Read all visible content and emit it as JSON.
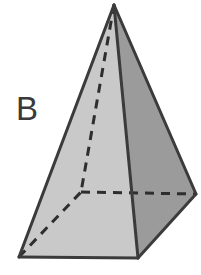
{
  "figure": {
    "label": "B",
    "shape_name": "square-pyramid",
    "projection": "oblique",
    "colors": {
      "background": "#ffffff",
      "left_face_fill": "#c9c9c9",
      "right_face_fill": "#9b9b9b",
      "base_front_fill": "#cfcfcf",
      "outline": "#3b3b3b",
      "hidden_edge": "#2e2e2e",
      "label_color": "#3a3a3a"
    },
    "stroke": {
      "outline_width": 3,
      "hidden_width": 3,
      "hidden_dash": "9 7"
    },
    "vertices": {
      "apex": {
        "x": 114,
        "y": 5
      },
      "base_left": {
        "x": 19,
        "y": 257
      },
      "base_front": {
        "x": 138,
        "y": 258
      },
      "base_right": {
        "x": 196,
        "y": 194
      },
      "base_back_hidden": {
        "x": 81,
        "y": 192
      }
    },
    "faces": [
      {
        "name": "left-visible-face",
        "points": "114,5 19,257 138,258",
        "fill": "#c9c9c9"
      },
      {
        "name": "right-visible-face",
        "points": "114,5 138,258 196,194",
        "fill": "#9b9b9b"
      }
    ],
    "visible_edges": [
      {
        "name": "apex-to-base-left",
        "x1": 114,
        "y1": 5,
        "x2": 19,
        "y2": 257
      },
      {
        "name": "apex-to-base-front",
        "x1": 114,
        "y1": 5,
        "x2": 138,
        "y2": 258
      },
      {
        "name": "apex-to-base-right",
        "x1": 114,
        "y1": 5,
        "x2": 196,
        "y2": 194
      },
      {
        "name": "base-left-to-base-front",
        "x1": 19,
        "y1": 257,
        "x2": 138,
        "y2": 258
      },
      {
        "name": "base-front-to-base-right",
        "x1": 138,
        "y1": 258,
        "x2": 196,
        "y2": 194
      }
    ],
    "hidden_edges": [
      {
        "name": "apex-to-back-vertex",
        "x1": 114,
        "y1": 5,
        "x2": 81,
        "y2": 192
      },
      {
        "name": "base-left-to-back-vertex",
        "x1": 19,
        "y1": 257,
        "x2": 81,
        "y2": 192
      },
      {
        "name": "back-vertex-to-base-right",
        "x1": 81,
        "y1": 192,
        "x2": 196,
        "y2": 194
      }
    ]
  }
}
